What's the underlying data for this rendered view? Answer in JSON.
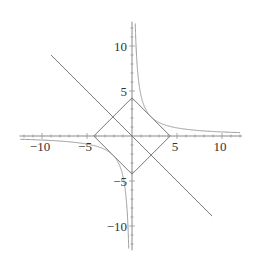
{
  "chart_data": {
    "type": "line",
    "title": "",
    "xlabel": "",
    "ylabel": "",
    "xlim": [
      -12.5,
      12.2
    ],
    "ylim": [
      -12.7,
      12.7
    ],
    "grid": false,
    "legend": null,
    "x_ticks": [
      -10,
      -5,
      5,
      10
    ],
    "x_tick_labels": [
      "−10",
      "−5",
      "5",
      "10"
    ],
    "y_ticks": [
      -10,
      -5,
      5,
      10
    ],
    "y_tick_labels": [
      "−10",
      "−5",
      "5",
      "10"
    ],
    "series": [
      {
        "name": "diamond |x|+|y|=3√2",
        "kind": "polygon",
        "points": [
          [
            4.24,
            0
          ],
          [
            0,
            4.24
          ],
          [
            -4.24,
            0
          ],
          [
            0,
            -4.24
          ]
        ],
        "color": "#7a7a7a"
      },
      {
        "name": "line y=-x",
        "kind": "segment",
        "points": [
          [
            -9.0,
            9.0
          ],
          [
            8.9,
            -8.9
          ]
        ],
        "color": "#7a7a7a"
      },
      {
        "name": "hyperbola xy=4.5 (first quadrant)",
        "kind": "function",
        "formula": "4.5/x",
        "x_range": [
          0.36,
          12.0
        ],
        "color": "#9a9a9a"
      },
      {
        "name": "hyperbola xy=4.5 (third quadrant)",
        "kind": "function",
        "formula": "4.5/x",
        "x_range": [
          -12.4,
          -0.36
        ],
        "color": "#9a9a9a"
      }
    ],
    "axis_color": "#8a8a8a"
  },
  "layout": {
    "origin_px": [
      132,
      136
    ],
    "px_per_unit": 9.0
  }
}
